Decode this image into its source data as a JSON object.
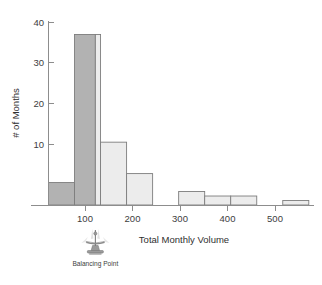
{
  "chart_data": {
    "type": "bar",
    "title": "",
    "xlabel": "Total Monthly Volume",
    "ylabel": "# of Months",
    "bin_width": 50,
    "bin_starts": [
      50,
      100,
      150,
      200,
      300,
      350,
      400,
      500
    ],
    "categories": [
      "50-100",
      "100-150",
      "150-200",
      "200-250",
      "300-350",
      "350-400",
      "400-450",
      "500-550"
    ],
    "values": [
      5,
      38,
      14,
      7,
      3,
      2,
      2,
      1
    ],
    "xlim": [
      50,
      560
    ],
    "ylim": [
      0,
      41
    ],
    "xticks": [
      100,
      200,
      300,
      400,
      500
    ],
    "xtick_labels": [
      "100",
      "200",
      "300",
      "400",
      "500"
    ],
    "yticks": [
      10,
      20,
      30,
      40
    ],
    "ytick_labels": [
      "10",
      "20",
      "30",
      "40"
    ],
    "grid": false,
    "legend": false,
    "annotations": [
      {
        "name": "balancing-point",
        "label": "Balancing Point",
        "x_value": 140,
        "icon": "fulcrum-icon"
      }
    ],
    "shading": {
      "dark_region_upto": 140,
      "dark_color": "#b2b2b2",
      "light_color": "#ececec",
      "outline_color": "#7d7d7d"
    }
  },
  "axes": {
    "x_title": "Total Monthly Volume",
    "y_title": "# of Months"
  }
}
